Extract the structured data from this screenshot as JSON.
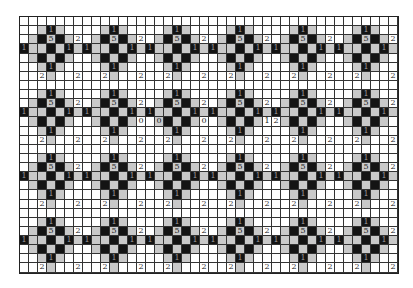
{
  "puzzle": {
    "rows": 28,
    "cols": 42,
    "cell_width": 9,
    "cell_height": 9.14,
    "colors": {
      "white": "#ffffff",
      "gray": "#c9c9c9",
      "black": "#141414",
      "grid": "#333333"
    },
    "motif_centers_rows": [
      2,
      9,
      16,
      23
    ],
    "motif_centers_cols": [
      3,
      10,
      17,
      24,
      31,
      38
    ],
    "motif": [
      {
        "dr": -1,
        "dc": -1,
        "fill": "g"
      },
      {
        "dr": -1,
        "dc": 0,
        "fill": "b",
        "num": "1"
      },
      {
        "dr": -1,
        "dc": 1,
        "fill": "g"
      },
      {
        "dr": 0,
        "dc": -2,
        "fill": "g"
      },
      {
        "dr": 0,
        "dc": -1,
        "fill": "b"
      },
      {
        "dr": 0,
        "dc": 0,
        "fill": "g",
        "num": "5"
      },
      {
        "dr": 0,
        "dc": 1,
        "fill": "b"
      },
      {
        "dr": 0,
        "dc": 2,
        "fill": "g"
      },
      {
        "dr": 0,
        "dc": 3,
        "fill": "w",
        "num": "2"
      },
      {
        "dr": 1,
        "dc": -3,
        "fill": "b",
        "num": "1"
      },
      {
        "dr": 1,
        "dc": -2,
        "fill": "g"
      },
      {
        "dr": 1,
        "dc": -1,
        "fill": "g"
      },
      {
        "dr": 1,
        "dc": 0,
        "fill": "b"
      },
      {
        "dr": 1,
        "dc": 1,
        "fill": "g"
      },
      {
        "dr": 1,
        "dc": 2,
        "fill": "b",
        "num": "1"
      },
      {
        "dr": 1,
        "dc": 3,
        "fill": "g"
      },
      {
        "dr": 2,
        "dc": -2,
        "fill": "g"
      },
      {
        "dr": 2,
        "dc": -1,
        "fill": "b"
      },
      {
        "dr": 2,
        "dc": 0,
        "fill": "g"
      },
      {
        "dr": 2,
        "dc": 1,
        "fill": "b"
      },
      {
        "dr": 2,
        "dc": 2,
        "fill": "g"
      },
      {
        "dr": 3,
        "dc": -1,
        "fill": "g"
      },
      {
        "dr": 3,
        "dc": 0,
        "fill": "b",
        "num": "1"
      },
      {
        "dr": 3,
        "dc": 1,
        "fill": "g"
      },
      {
        "dr": 4,
        "dc": -1,
        "fill": "w",
        "num": "2"
      },
      {
        "dr": 4,
        "dc": 0,
        "fill": "g"
      },
      {
        "dr": 4,
        "dc": 3,
        "fill": "w",
        "num": "2"
      }
    ],
    "extra_labels": [
      {
        "r": 11,
        "c": 13,
        "num": "0"
      },
      {
        "r": 11,
        "c": 15,
        "num": "0"
      },
      {
        "r": 11,
        "c": 20,
        "num": "0"
      },
      {
        "r": 11,
        "c": 27,
        "num": "1"
      },
      {
        "r": 11,
        "c": 28,
        "num": "2"
      }
    ]
  }
}
